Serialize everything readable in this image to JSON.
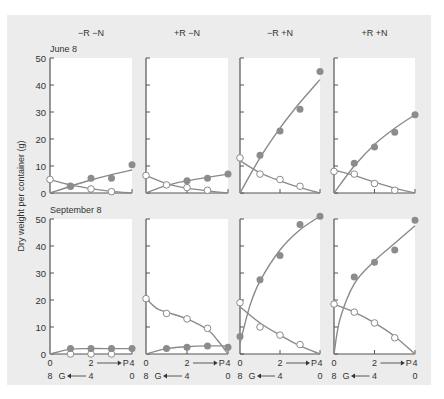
{
  "chart_data": {
    "type": "scatter",
    "ylabel": "Dry weight per container (g)",
    "ylim": [
      0,
      50
    ],
    "yticks": [
      0,
      10,
      20,
      30,
      40,
      50
    ],
    "x_axis": {
      "top_label_values": [
        "0",
        "2",
        "P",
        "4"
      ],
      "bottom_label_values": [
        "8",
        "G",
        "4",
        "0"
      ],
      "x_range": [
        0,
        4
      ],
      "description": "P increases left to right (0 to 4); G decreases left to right (8 to 0)"
    },
    "columns": [
      "−R −N",
      "+R −N",
      "−R +N",
      "+R +N"
    ],
    "rows": [
      "June 8",
      "September 8"
    ],
    "series_legend": {
      "filled": "P (filled circles)",
      "open": "G (open circles)"
    },
    "panels": [
      {
        "row": "June 8",
        "column": "−R −N",
        "filled": {
          "x": [
            1,
            2,
            3,
            4
          ],
          "y": [
            2.5,
            5.5,
            5.5,
            10.5
          ]
        },
        "open": {
          "x": [
            0,
            1,
            2,
            3
          ],
          "y": [
            5,
            2.5,
            1.5,
            0.5
          ]
        },
        "filled_fit": [
          [
            0,
            0
          ],
          [
            1,
            2.5
          ],
          [
            2,
            4.8
          ],
          [
            3,
            6.8
          ],
          [
            4,
            8.5
          ]
        ],
        "open_fit": [
          [
            0,
            5
          ],
          [
            1,
            3
          ],
          [
            2,
            1.6
          ],
          [
            3,
            0.6
          ],
          [
            4,
            0
          ]
        ]
      },
      {
        "row": "June 8",
        "column": "+R −N",
        "filled": {
          "x": [
            2,
            3,
            4
          ],
          "y": [
            4.5,
            5.5,
            7
          ]
        },
        "open": {
          "x": [
            0,
            1,
            2,
            3
          ],
          "y": [
            6.5,
            3,
            2,
            1
          ]
        },
        "filled_fit": [
          [
            0,
            0
          ],
          [
            1,
            2.8
          ],
          [
            2,
            4.5
          ],
          [
            3,
            5.8
          ],
          [
            4,
            7
          ]
        ],
        "open_fit": [
          [
            0,
            6.5
          ],
          [
            1,
            3.5
          ],
          [
            2,
            1.8
          ],
          [
            3,
            0.8
          ],
          [
            4,
            0
          ]
        ]
      },
      {
        "row": "June 8",
        "column": "−R +N",
        "filled": {
          "x": [
            1,
            2,
            3,
            4
          ],
          "y": [
            14,
            23,
            31,
            45
          ]
        },
        "open": {
          "x": [
            0,
            1,
            2,
            3
          ],
          "y": [
            13,
            7,
            5,
            2.5
          ]
        },
        "filled_fit": [
          [
            0,
            0
          ],
          [
            1,
            13
          ],
          [
            2,
            24
          ],
          [
            3,
            33.5
          ],
          [
            4,
            42
          ]
        ],
        "open_fit": [
          [
            0,
            12
          ],
          [
            1,
            7.5
          ],
          [
            2,
            4.5
          ],
          [
            3,
            2
          ],
          [
            4,
            0
          ]
        ]
      },
      {
        "row": "June 8",
        "column": "+R +N",
        "filled": {
          "x": [
            1,
            2,
            3,
            4
          ],
          "y": [
            11,
            17,
            22.5,
            29
          ]
        },
        "open": {
          "x": [
            0,
            1,
            2,
            3
          ],
          "y": [
            8,
            7,
            3.5,
            1
          ]
        },
        "filled_fit": [
          [
            0,
            0
          ],
          [
            1,
            10
          ],
          [
            2,
            18
          ],
          [
            3,
            24
          ],
          [
            4,
            29
          ]
        ],
        "open_fit": [
          [
            0,
            8.5
          ],
          [
            1,
            6.5
          ],
          [
            2,
            4
          ],
          [
            3,
            1.8
          ],
          [
            4,
            0
          ]
        ]
      },
      {
        "row": "September 8",
        "column": "−R −N",
        "filled": {
          "x": [
            1,
            2,
            3,
            4
          ],
          "y": [
            2,
            2,
            2,
            2
          ]
        },
        "open": {
          "x": [
            1,
            2,
            3
          ],
          "y": [
            0,
            0,
            0
          ]
        },
        "filled_fit": [
          [
            0,
            0
          ],
          [
            1,
            1.8
          ],
          [
            2,
            2
          ],
          [
            3,
            2
          ],
          [
            4,
            2
          ]
        ],
        "open_fit": []
      },
      {
        "row": "September 8",
        "column": "+R −N",
        "filled": {
          "x": [
            1,
            2,
            3,
            4
          ],
          "y": [
            2,
            2.5,
            3,
            2.5
          ]
        },
        "open": {
          "x": [
            0,
            1,
            2,
            3
          ],
          "y": [
            20.5,
            15,
            13,
            9.5
          ]
        },
        "filled_fit": [
          [
            0,
            0
          ],
          [
            1,
            2
          ],
          [
            2,
            2.7
          ],
          [
            3,
            3
          ],
          [
            4,
            3
          ]
        ],
        "open_fit": [
          [
            0,
            20.5
          ],
          [
            0.5,
            17
          ],
          [
            1,
            15.5
          ],
          [
            2,
            13
          ],
          [
            3,
            9
          ],
          [
            3.5,
            5
          ],
          [
            4,
            0
          ]
        ]
      },
      {
        "row": "September 8",
        "column": "−R +N",
        "filled": {
          "x": [
            0,
            1,
            2,
            3,
            4
          ],
          "y": [
            6.5,
            27.5,
            36.5,
            48,
            51
          ]
        },
        "open": {
          "x": [
            0,
            1,
            2,
            3
          ],
          "y": [
            19,
            10,
            7,
            3.5
          ]
        },
        "filled_fit": [
          [
            0,
            4
          ],
          [
            0.5,
            18
          ],
          [
            1,
            27
          ],
          [
            2,
            38.5
          ],
          [
            3,
            46
          ],
          [
            4,
            51
          ]
        ],
        "open_fit": [
          [
            0,
            17.5
          ],
          [
            1,
            11.5
          ],
          [
            2,
            7
          ],
          [
            3,
            3
          ],
          [
            4,
            0
          ]
        ]
      },
      {
        "row": "September 8",
        "column": "+R +N",
        "filled": {
          "x": [
            1,
            2,
            3,
            4
          ],
          "y": [
            28.5,
            34,
            38.5,
            49.5
          ]
        },
        "open": {
          "x": [
            0,
            1,
            2,
            3
          ],
          "y": [
            18.5,
            15.5,
            11.5,
            6
          ]
        },
        "filled_fit": [
          [
            0,
            0
          ],
          [
            0.3,
            13
          ],
          [
            1,
            26
          ],
          [
            2,
            34.5
          ],
          [
            3,
            41
          ],
          [
            4,
            47.5
          ]
        ],
        "open_fit": [
          [
            0,
            18.5
          ],
          [
            1,
            15.5
          ],
          [
            2,
            11.5
          ],
          [
            3,
            6.5
          ],
          [
            4,
            0
          ]
        ]
      }
    ]
  },
  "labels": {
    "col_1": "−R −N",
    "col_2": "+R −N",
    "col_3": "−R +N",
    "col_4": "+R +N",
    "row_1": "June 8",
    "row_2": "September 8",
    "ylabel": "Dry weight per container (g)",
    "xtick_top": [
      "0",
      "2",
      "P",
      "4"
    ],
    "xtick_bottom": [
      "8",
      "G",
      "4",
      "0"
    ]
  },
  "colors": {
    "background": "#ececec",
    "panel": "#ffffff",
    "axis": "#555555",
    "line": "#8a8a8a",
    "filled_marker": "#8c8c8c",
    "open_marker_stroke": "#8a8a8a"
  }
}
